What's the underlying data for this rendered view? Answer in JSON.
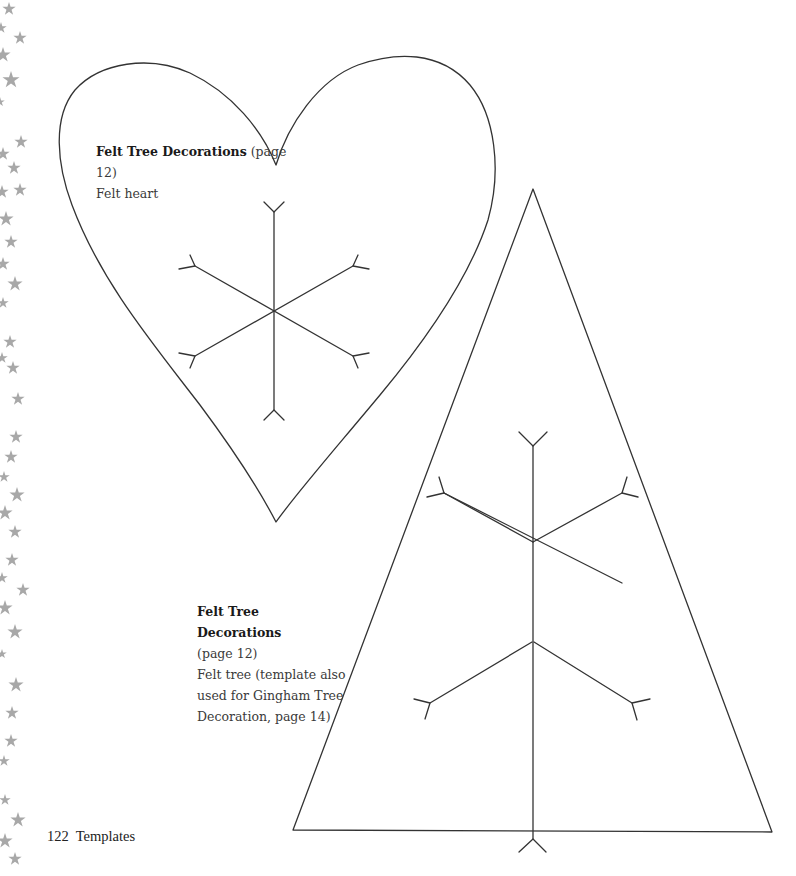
{
  "page": {
    "page_number": "122",
    "section": "Templates",
    "footer_text": "122  Templates"
  },
  "templates": {
    "heart": {
      "title": "Felt Tree Decorations",
      "page_ref": "(page 12)",
      "description": "Felt heart",
      "shape": "heart",
      "motif": "snowflake-icon"
    },
    "tree": {
      "title": "Felt Tree Decorations",
      "page_ref": "(page 12)",
      "description_lines": [
        "Felt tree (template also",
        "used for Gingham Tree",
        "Decoration, page 14)"
      ],
      "shape": "triangle",
      "motif": "snowflake-icon"
    }
  },
  "decoration": {
    "border": "star-border",
    "star_color": "#a8a8a8",
    "line_color": "#333333"
  }
}
